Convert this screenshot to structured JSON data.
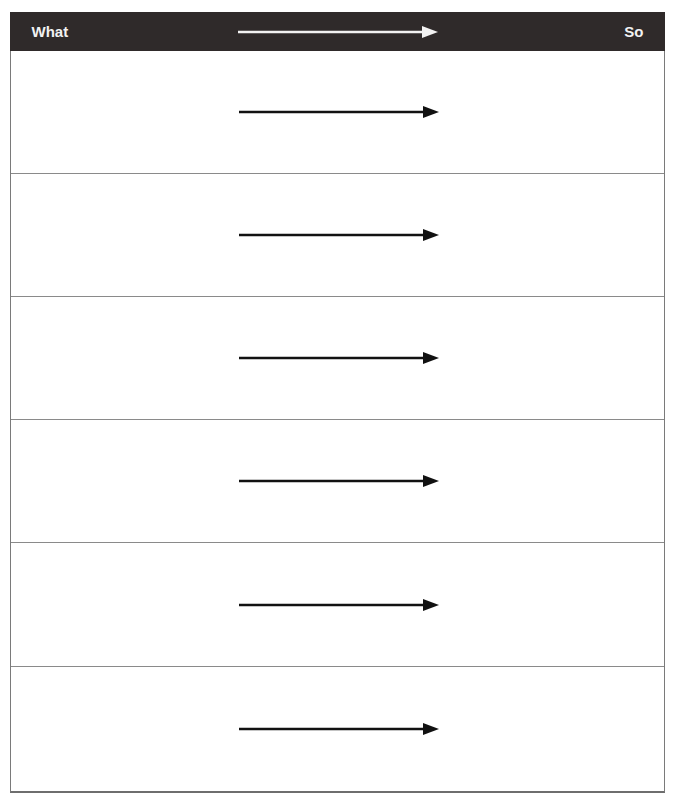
{
  "header": {
    "left_label": "What",
    "right_label": "So",
    "arrow_icon": "right-arrow-icon",
    "background_color": "#2f2a2a",
    "text_color": "#f2f2f2"
  },
  "rows": [
    {
      "what": "",
      "so": "",
      "arrow_icon": "right-arrow-icon"
    },
    {
      "what": "",
      "so": "",
      "arrow_icon": "right-arrow-icon"
    },
    {
      "what": "",
      "so": "",
      "arrow_icon": "right-arrow-icon"
    },
    {
      "what": "",
      "so": "",
      "arrow_icon": "right-arrow-icon"
    },
    {
      "what": "",
      "so": "",
      "arrow_icon": "right-arrow-icon"
    },
    {
      "what": "",
      "so": "",
      "arrow_icon": "right-arrow-icon"
    }
  ]
}
